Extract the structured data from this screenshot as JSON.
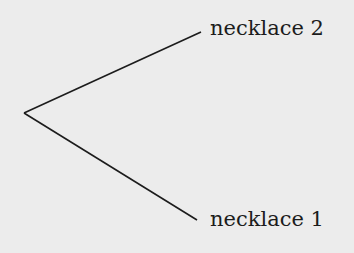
{
  "diagram": {
    "type": "tree",
    "root": {
      "x": 24,
      "y": 113
    },
    "branches": [
      {
        "label": "necklace 2",
        "end": {
          "x": 201,
          "y": 32
        }
      },
      {
        "label": "necklace 1",
        "end": {
          "x": 197,
          "y": 220
        }
      }
    ],
    "colors": {
      "background": "#ececec",
      "line": "#1c1c1c",
      "text": "#1c1c1c"
    }
  }
}
